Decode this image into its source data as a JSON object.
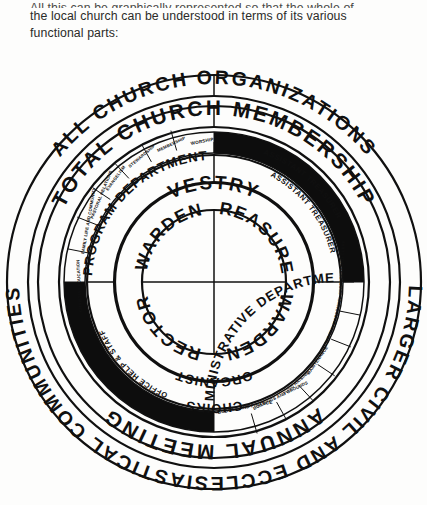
{
  "intro": {
    "line1": "All this can be graphically represented so that the whole of",
    "line2": "the local church can be understood in terms of its various",
    "line3": "functional parts:"
  },
  "diagram": {
    "type": "concentric-ring-organizational-chart",
    "rings": {
      "outer_top": "ALL CHURCH ORGANIZATIONS",
      "outer_bottom": "LARGER CIVIL AND ECCLESIASTICAL COMMUNITIES",
      "ring2_top": "TOTAL CHURCH MEMBERSHIP",
      "ring2_bottom": "ANNUAL MEETING",
      "ring4_upper_left": "PROGRAM DEPARTMENT",
      "ring4_lower_right": "ADMINISTRATIVE DEPARTMENT",
      "ring4_assistant_1": "ASSISTANT TREASURER",
      "ring4_assistant_2": "ASSISTANT TREASURER",
      "ring4_office": "OFFICE HELP & STAFF",
      "ring5_top": "VESTRY",
      "ring5_organist": "ORGANIST",
      "ring3_choirs": "CHOIRS"
    },
    "center_quadrants": [
      {
        "position": "top-left",
        "label": "WARDEN"
      },
      {
        "position": "top-right",
        "label": "TREASURER"
      },
      {
        "position": "bottom-left",
        "label": "RECTOR"
      },
      {
        "position": "bottom-right",
        "label": "WARDEN"
      }
    ],
    "program_subdepartments": [
      "WORSHIP",
      "MEMBERSHIP",
      "STEWARDSHIP",
      "EVANGELISM",
      "PASTORAL RELATIONS",
      "FAMILY LIFE AND COMMUNITY",
      "CHRISTIAN EDUCATION"
    ],
    "administrative_subdepartments": [
      "BUDGET AND FINANCE",
      "BUILDINGS AND GROUNDS",
      "FUND RAISING",
      "MAINTENANCE",
      "ALTAR GUILD",
      "PERSONNEL",
      "SECRETARY AND CLERK"
    ],
    "colors": {
      "ink": "#101010",
      "fill_black": "#0d0d0d",
      "paper": "#fdfdfc"
    }
  }
}
